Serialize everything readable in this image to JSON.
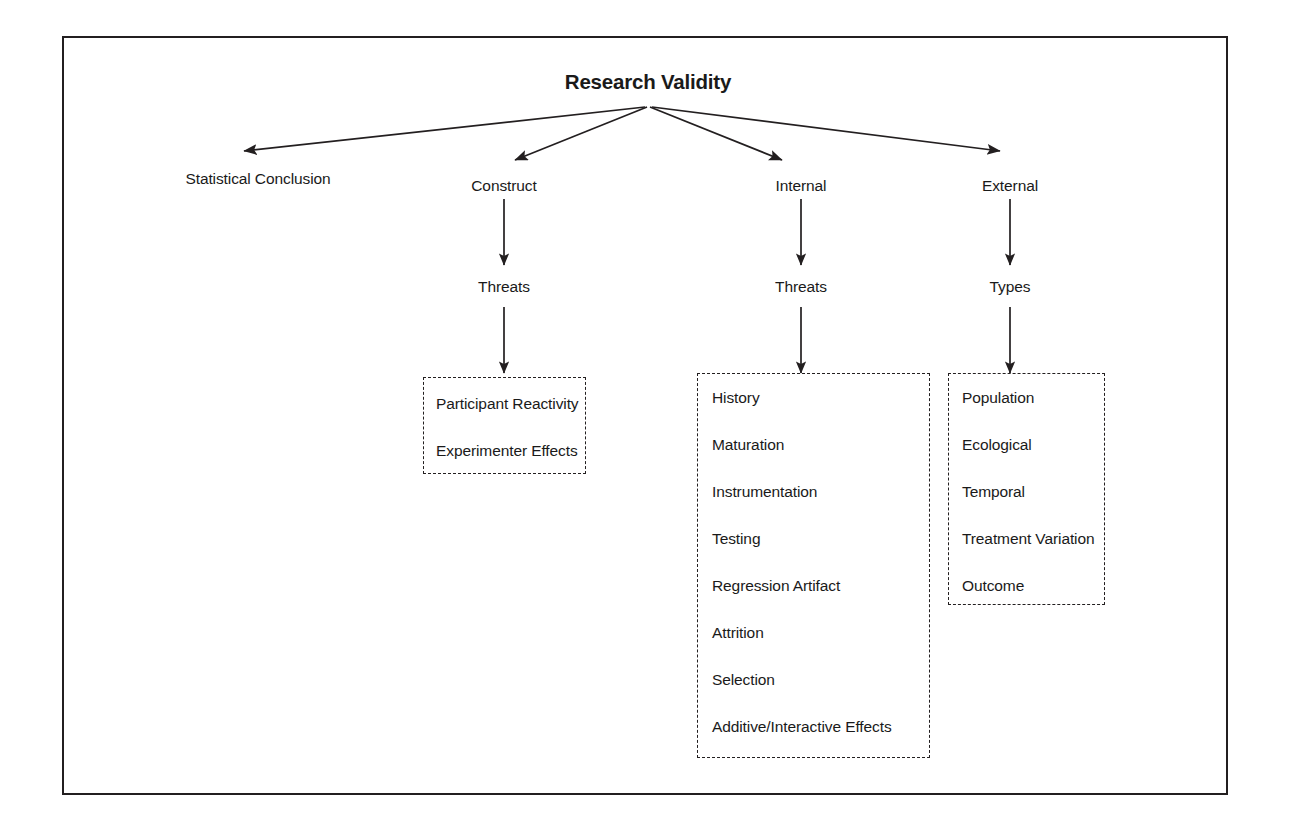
{
  "diagram": {
    "type": "hierarchy-tree",
    "root": {
      "label": "Research Validity"
    },
    "branches": [
      {
        "key": "statistical-conclusion",
        "label": "Statistical Conclusion",
        "child_label": null,
        "items": []
      },
      {
        "key": "construct",
        "label": "Construct",
        "child_label": "Threats",
        "items": [
          "Participant Reactivity",
          "Experimenter Effects"
        ]
      },
      {
        "key": "internal",
        "label": "Internal",
        "child_label": "Threats",
        "items": [
          "History",
          "Maturation",
          "Instrumentation",
          "Testing",
          "Regression Artifact",
          "Attrition",
          "Selection",
          "Additive/Interactive Effects"
        ]
      },
      {
        "key": "external",
        "label": "External",
        "child_label": "Types",
        "items": [
          "Population",
          "Ecological",
          "Temporal",
          "Treatment Variation",
          "Outcome"
        ]
      }
    ],
    "colors": {
      "line": "#231f20",
      "text": "#1a1a1a",
      "background": "#ffffff",
      "frame": "#231f20"
    }
  }
}
